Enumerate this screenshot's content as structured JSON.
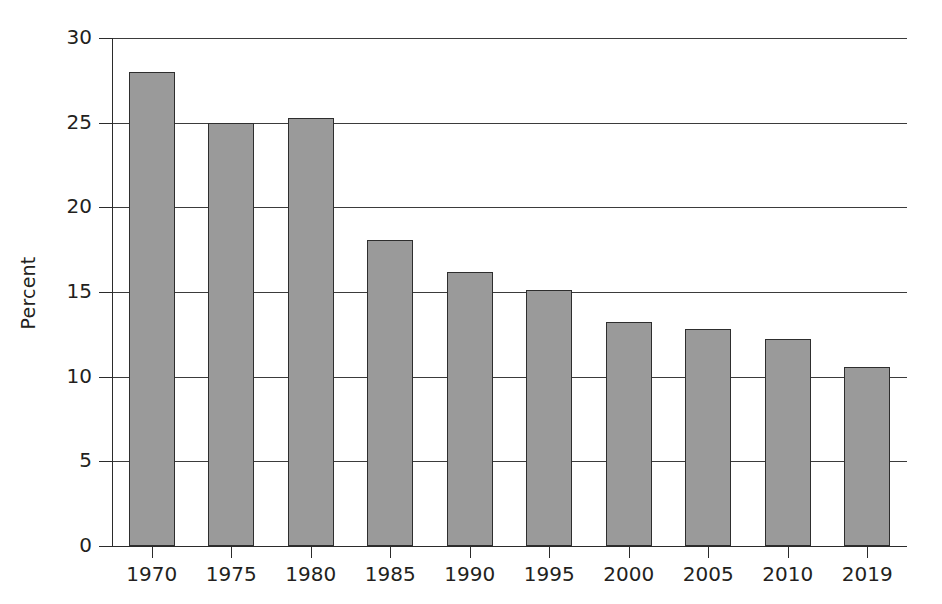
{
  "chart_data": {
    "type": "bar",
    "title": "",
    "subtitle": "",
    "xlabel": "",
    "ylabel": "Percent",
    "categories": [
      "1970",
      "1975",
      "1980",
      "1985",
      "1990",
      "1995",
      "2000",
      "2005",
      "2010",
      "2019"
    ],
    "values": [
      28.0,
      25.0,
      25.3,
      18.1,
      16.2,
      15.1,
      13.2,
      12.8,
      12.2,
      10.6
    ],
    "series": [
      {
        "name": "Percent",
        "values": [
          28.0,
          25.0,
          25.3,
          18.1,
          16.2,
          15.1,
          13.2,
          12.8,
          12.2,
          10.6
        ]
      }
    ],
    "ylim": [
      0,
      30
    ],
    "yticks": [
      0,
      5,
      10,
      15,
      20,
      25,
      30
    ],
    "ytick_labels": [
      "0",
      "5",
      "10",
      "15",
      "20",
      "25",
      "30"
    ],
    "grid": "horizontal",
    "legend": "none",
    "bar_fill_color": "#9a9a9a",
    "bar_border_color": "#2e2e2e",
    "axis_color": "#2b2b2b",
    "background_color": "#ffffff",
    "annotations": []
  },
  "axes": {
    "y_label_text": "Percent"
  }
}
